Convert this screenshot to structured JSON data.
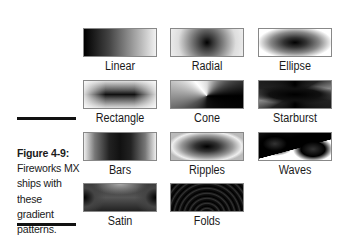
{
  "figure": {
    "number": "Figure 4-9:",
    "caption": "Fireworks MX ships with these gradient patterns."
  },
  "gradients": [
    {
      "name": "Linear",
      "style": "g-linear"
    },
    {
      "name": "Radial",
      "style": "g-radial"
    },
    {
      "name": "Ellipse",
      "style": "g-ellipse"
    },
    {
      "name": "Rectangle",
      "style": "g-rect"
    },
    {
      "name": "Cone",
      "style": "g-cone"
    },
    {
      "name": "Starburst",
      "style": "g-starburst"
    },
    {
      "name": "Bars",
      "style": "g-bars"
    },
    {
      "name": "Ripples",
      "style": "g-ripples"
    },
    {
      "name": "Waves",
      "style": "g-waves"
    },
    {
      "name": "Satin",
      "style": "g-satin"
    },
    {
      "name": "Folds",
      "style": "g-folds"
    }
  ]
}
